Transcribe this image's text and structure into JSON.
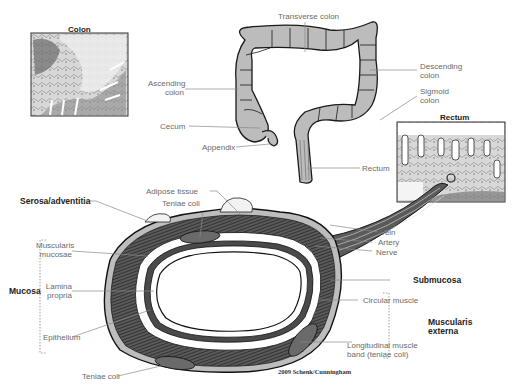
{
  "micrographs": {
    "colon": {
      "title": "Colon"
    },
    "rectum": {
      "title": "Rectum"
    }
  },
  "large_intestine_labels": {
    "transverse_colon": "Transverse colon",
    "ascending_colon_1": "Ascending",
    "ascending_colon_2": "colon",
    "descending_colon_1": "Descending",
    "descending_colon_2": "colon",
    "sigmoid_colon_1": "Sigmoid",
    "sigmoid_colon_2": "colon",
    "cecum": "Cecum",
    "appendix": "Appendix",
    "rectum": "Rectum"
  },
  "cross_section_labels": {
    "adipose_tissue": "Adipose tissue",
    "teniae_coli_top": "Teniae coli",
    "serosa_adventitia": "Serosa/adventitia",
    "muscularis_mucosae_1": "Muscularis",
    "muscularis_mucosae_2": "mucosae",
    "lamina_propria_1": "Lamina",
    "lamina_propria_2": "propria",
    "epithelium": "Epithelium",
    "teniae_coli_bottom": "Teniae coli",
    "vein": "Vein",
    "artery": "Artery",
    "nerve": "Nerve",
    "submucosa": "Submucosa",
    "circular_muscle": "Circular muscle",
    "longitudinal_1": "Longitudinal muscle",
    "longitudinal_2": "band (teniae coli)"
  },
  "group_labels": {
    "mucosa": "Mucosa",
    "muscularis_externa_1": "Muscularis",
    "muscularis_externa_2": "externa"
  },
  "credit": "2009 Schenk/Cunningham",
  "colors": {
    "outline": "#1a1a1a",
    "colon_fill": "#b9b9b9",
    "muscle": "#4a4a4a",
    "serosa": "#bdbdbd",
    "leader": "#8a8a8a"
  }
}
